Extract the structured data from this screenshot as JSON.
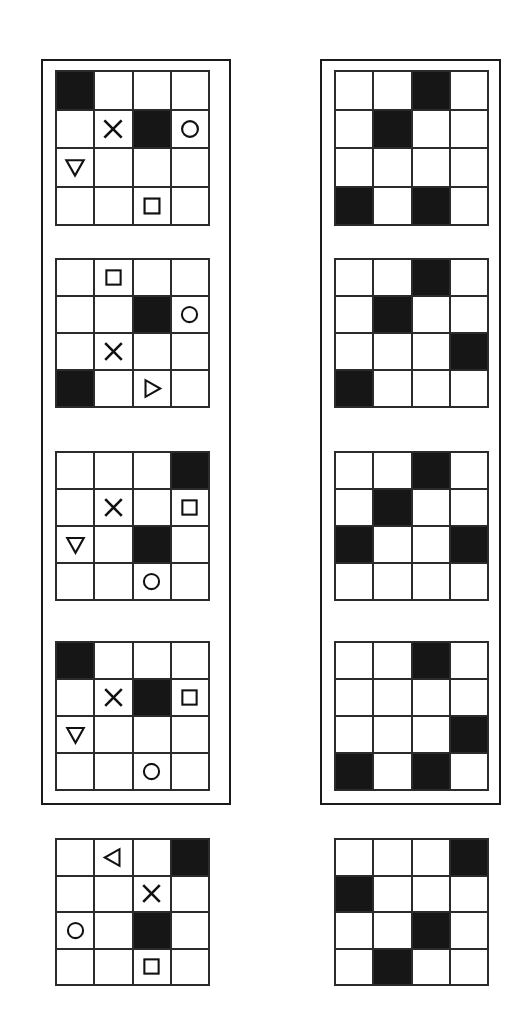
{
  "doc": {
    "kind": "abstract-reasoning-matrix-figure",
    "grid_size": 4,
    "colors": {
      "fill": "#161616",
      "line": "#2b2b2b",
      "frame": "#1a1a1a",
      "background": "#ffffff"
    },
    "glyph_names": {
      "x": "x-mark-icon",
      "circle": "circle-outline-icon",
      "square": "square-outline-icon",
      "triangle_down": "triangle-down-icon",
      "triangle_right": "triangle-right-icon",
      "triangle_left": "triangle-left-icon",
      "filled": "filled-cell",
      "empty": "empty-cell"
    }
  },
  "groups": [
    {
      "name": "left-group",
      "label": "Left column group frame",
      "panels": [
        {
          "name": "left-panel-1",
          "top": 70,
          "height": 156,
          "cells": [
            [
              "filled",
              "empty",
              "empty",
              "empty"
            ],
            [
              "empty",
              "x",
              "filled",
              "circle"
            ],
            [
              "triangle_down",
              "empty",
              "empty",
              "empty"
            ],
            [
              "empty",
              "empty",
              "square",
              "empty"
            ]
          ]
        },
        {
          "name": "left-panel-2",
          "top": 258,
          "height": 150,
          "cells": [
            [
              "empty",
              "square",
              "empty",
              "empty"
            ],
            [
              "empty",
              "empty",
              "filled",
              "circle"
            ],
            [
              "empty",
              "x",
              "empty",
              "empty"
            ],
            [
              "filled",
              "empty",
              "triangle_right",
              "empty"
            ]
          ]
        },
        {
          "name": "left-panel-3",
          "top": 451,
          "height": 150,
          "cells": [
            [
              "empty",
              "empty",
              "empty",
              "filled"
            ],
            [
              "empty",
              "x",
              "empty",
              "square"
            ],
            [
              "triangle_down",
              "empty",
              "filled",
              "empty"
            ],
            [
              "empty",
              "empty",
              "circle",
              "empty"
            ]
          ]
        },
        {
          "name": "left-panel-4",
          "top": 641,
          "height": 150,
          "cells": [
            [
              "filled",
              "empty",
              "empty",
              "empty"
            ],
            [
              "empty",
              "x",
              "filled",
              "square"
            ],
            [
              "triangle_down",
              "empty",
              "empty",
              "empty"
            ],
            [
              "empty",
              "empty",
              "circle",
              "empty"
            ]
          ]
        }
      ]
    },
    {
      "name": "right-group",
      "label": "Right column group frame",
      "panels": [
        {
          "name": "right-panel-1",
          "top": 70,
          "height": 156,
          "cells": [
            [
              "empty",
              "empty",
              "filled",
              "empty"
            ],
            [
              "empty",
              "filled",
              "empty",
              "empty"
            ],
            [
              "empty",
              "empty",
              "empty",
              "empty"
            ],
            [
              "filled",
              "empty",
              "filled",
              "empty"
            ]
          ]
        },
        {
          "name": "right-panel-2",
          "top": 258,
          "height": 150,
          "cells": [
            [
              "empty",
              "empty",
              "filled",
              "empty"
            ],
            [
              "empty",
              "filled",
              "empty",
              "empty"
            ],
            [
              "empty",
              "empty",
              "empty",
              "filled"
            ],
            [
              "filled",
              "empty",
              "empty",
              "empty"
            ]
          ]
        },
        {
          "name": "right-panel-3",
          "top": 451,
          "height": 150,
          "cells": [
            [
              "empty",
              "empty",
              "filled",
              "empty"
            ],
            [
              "empty",
              "filled",
              "empty",
              "empty"
            ],
            [
              "filled",
              "empty",
              "empty",
              "filled"
            ],
            [
              "empty",
              "empty",
              "empty",
              "empty"
            ]
          ]
        },
        {
          "name": "right-panel-4",
          "top": 641,
          "height": 150,
          "cells": [
            [
              "empty",
              "empty",
              "filled",
              "empty"
            ],
            [
              "empty",
              "empty",
              "empty",
              "empty"
            ],
            [
              "empty",
              "empty",
              "empty",
              "filled"
            ],
            [
              "filled",
              "empty",
              "filled",
              "empty"
            ]
          ]
        }
      ]
    }
  ],
  "bottom": [
    {
      "name": "bottom-panel-left",
      "cells": [
        [
          "empty",
          "triangle_left",
          "empty",
          "filled"
        ],
        [
          "empty",
          "empty",
          "x",
          "empty"
        ],
        [
          "circle",
          "empty",
          "filled",
          "empty"
        ],
        [
          "empty",
          "empty",
          "square",
          "empty"
        ]
      ]
    },
    {
      "name": "bottom-panel-right",
      "cells": [
        [
          "empty",
          "empty",
          "empty",
          "filled"
        ],
        [
          "filled",
          "empty",
          "empty",
          "empty"
        ],
        [
          "empty",
          "empty",
          "filled",
          "empty"
        ],
        [
          "empty",
          "filled",
          "empty",
          "empty"
        ]
      ]
    }
  ]
}
